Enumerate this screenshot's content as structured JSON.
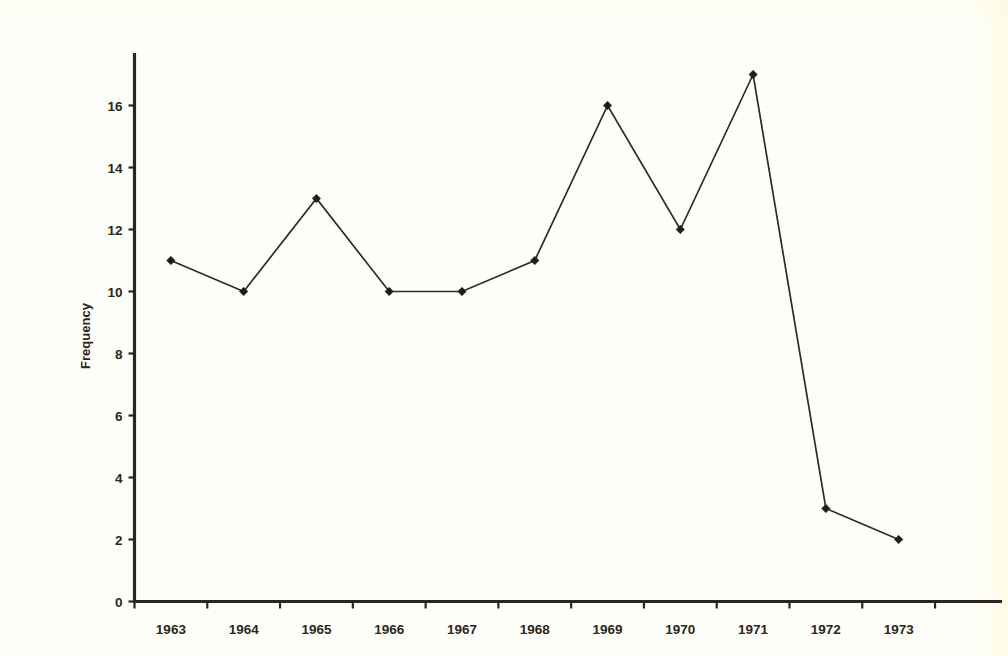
{
  "figure": {
    "background_color": "#fffffa",
    "ink_color": "#2a2520",
    "axis_title_y": "Frequency"
  },
  "chart_data": {
    "type": "line",
    "title": "",
    "subtitle": "",
    "xlabel": "",
    "ylabel": "Frequency",
    "categories": [
      "1963",
      "1964",
      "1965",
      "1966",
      "1967",
      "1968",
      "1969",
      "1970",
      "1971",
      "1972",
      "1973"
    ],
    "values": [
      11,
      10,
      13,
      10,
      10,
      11,
      16,
      12,
      17,
      3,
      2
    ],
    "series": [
      {
        "name": "Frequency",
        "values": [
          11,
          10,
          13,
          10,
          10,
          11,
          16,
          12,
          17,
          3,
          2
        ]
      }
    ],
    "ylim": [
      0,
      17.6
    ],
    "xlim": [
      0,
      11
    ],
    "y_ticks": [
      0,
      2,
      4,
      6,
      8,
      10,
      12,
      14,
      16
    ],
    "y_tick_labels": [
      "0",
      "2",
      "4",
      "6",
      "8",
      "10",
      "12",
      "14",
      "16"
    ],
    "x_tick_labels": [
      "1963",
      "1964",
      "1965",
      "1966",
      "1967",
      "1968",
      "1969",
      "1970",
      "1971",
      "1972",
      "1973"
    ],
    "grid": false,
    "legend": false,
    "legend_position": "none",
    "marker": "diamond",
    "line_color": "#33291f",
    "marker_color": "#241d16",
    "annotations": []
  }
}
